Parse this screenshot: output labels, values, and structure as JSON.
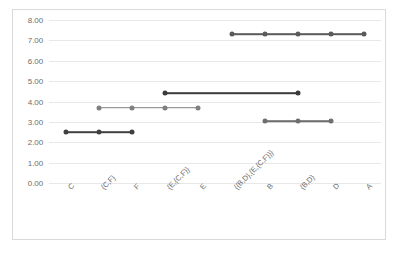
{
  "chart_data": {
    "type": "line",
    "title": "",
    "xlabel": "",
    "ylabel": "",
    "ylim": [
      0,
      8
    ],
    "ytick_labels": [
      "8.00",
      "7.00",
      "6.00",
      "5.00",
      "4.00",
      "3.00",
      "2.00",
      "1.00",
      "0.00"
    ],
    "ytick_values": [
      8,
      7,
      6,
      5,
      4,
      3,
      2,
      1,
      0
    ],
    "grid": true,
    "legend": "none",
    "categories": [
      "C",
      "{C,F}",
      "F",
      "{E,{C,F}}",
      "E",
      "{{B,D},{E,{C,F}}}",
      "B",
      "{B,D}",
      "D",
      "A"
    ],
    "series": [
      {
        "name": "series-1",
        "color": "#404040",
        "values": [
          2.48,
          2.48,
          2.48,
          null,
          null,
          null,
          null,
          null,
          null,
          null
        ]
      },
      {
        "name": "series-2",
        "color": "#808080",
        "values": [
          null,
          3.7,
          3.7,
          3.7,
          3.7,
          null,
          null,
          null,
          null,
          null
        ]
      },
      {
        "name": "series-3",
        "color": "#3b3b3b",
        "values": [
          null,
          null,
          null,
          4.42,
          null,
          null,
          null,
          4.42,
          null,
          null
        ]
      },
      {
        "name": "series-4",
        "color": "#6e6e6e",
        "values": [
          null,
          null,
          null,
          null,
          null,
          null,
          3.03,
          3.03,
          3.03,
          null
        ]
      },
      {
        "name": "series-5",
        "color": "#5a5a5a",
        "values": [
          null,
          null,
          null,
          null,
          null,
          7.3,
          7.3,
          7.3,
          7.3,
          7.3
        ]
      }
    ]
  },
  "style": {
    "plot_background": "#ffffff",
    "frame_border": "#d9d9d9",
    "gridline_color": "#e8e8e8",
    "tick_text_color": "#6d6d6d"
  }
}
